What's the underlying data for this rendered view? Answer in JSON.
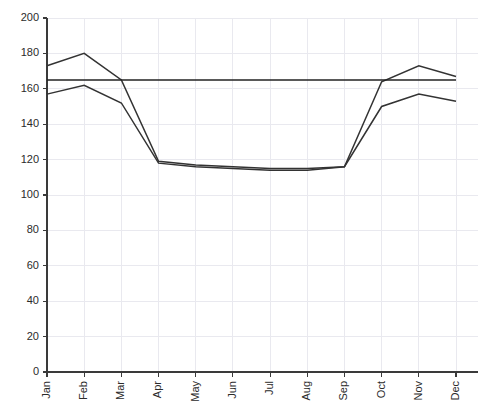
{
  "chart_data": {
    "type": "line",
    "title": "",
    "subtitle": "",
    "xlabel": "",
    "ylabel": "",
    "categories": [
      "Jan",
      "Feb",
      "Mar",
      "Apr",
      "May",
      "Jun",
      "Jul",
      "Aug",
      "Sep",
      "Oct",
      "Nov",
      "Dec"
    ],
    "series": [
      {
        "name": "upper",
        "color": "#333333",
        "values": [
          173,
          180,
          165,
          119,
          117,
          116,
          115,
          115,
          116,
          164,
          173,
          167
        ]
      },
      {
        "name": "lower",
        "color": "#333333",
        "values": [
          157,
          162,
          152,
          118,
          116,
          115,
          114,
          114,
          116,
          150,
          157,
          153
        ]
      },
      {
        "name": "constant",
        "color": "#222222",
        "values": [
          165,
          165,
          165,
          165,
          165,
          165,
          165,
          165,
          165,
          165,
          165,
          165
        ]
      }
    ],
    "ylim": [
      0,
      200
    ],
    "yticks": [
      0,
      20,
      40,
      60,
      80,
      100,
      120,
      140,
      160,
      180,
      200
    ],
    "ytick_labels": [
      "0",
      "20",
      "40",
      "60",
      "80",
      "100",
      "120",
      "140",
      "160",
      "180",
      "200"
    ],
    "grid": true,
    "grid_color": "#e9e9ef",
    "legend": false,
    "legend_position": "none",
    "xtick_rotation": 90,
    "background": "#ffffff",
    "axis_color": "#3a3a3a"
  }
}
